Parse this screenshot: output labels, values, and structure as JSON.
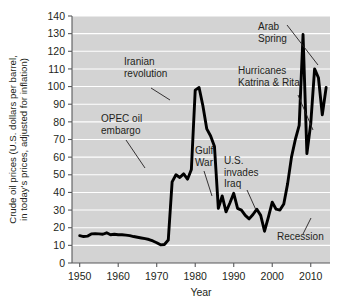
{
  "figure": {
    "name": "crude-oil-prices-chart",
    "background_color": "#ffffff",
    "plot_background_color": "#d3d3d3",
    "gridline_color": "#ffffff",
    "line_color": "#000000"
  },
  "chart_data": {
    "type": "line",
    "title": "",
    "xlabel": "Year",
    "ylabel": "Crude oil prices (U.S. dollars per barrel, in today's prices, adjusted for inflation)",
    "ylabel_line1": "Crude oil prices (U.S. dollars per barrel,",
    "ylabel_line2": "in today's prices, adjusted for inflation)",
    "xlim": [
      1948,
      2015
    ],
    "ylim": [
      0,
      140
    ],
    "grid": "horizontal",
    "legend": "none",
    "y_ticks": [
      0,
      10,
      20,
      30,
      40,
      50,
      60,
      70,
      80,
      90,
      100,
      110,
      120,
      130,
      140
    ],
    "x_ticks": [
      1950,
      1960,
      1970,
      1980,
      1990,
      2000,
      2010
    ],
    "series": [
      {
        "name": "Crude oil price (inflation adjusted)",
        "x": [
          1950,
          1951,
          1952,
          1953,
          1954,
          1955,
          1956,
          1957,
          1958,
          1959,
          1960,
          1961,
          1962,
          1963,
          1964,
          1965,
          1966,
          1967,
          1968,
          1969,
          1970,
          1971,
          1972,
          1973,
          1974,
          1975,
          1976,
          1977,
          1978,
          1979,
          1980,
          1981,
          1982,
          1983,
          1984,
          1985,
          1986,
          1987,
          1988,
          1989,
          1990,
          1991,
          1992,
          1993,
          1994,
          1995,
          1996,
          1997,
          1998,
          1999,
          2000,
          2001,
          2002,
          2003,
          2004,
          2005,
          2006,
          2007,
          2008,
          2009,
          2010,
          2011,
          2012,
          2013,
          2014
        ],
        "values": [
          15.5,
          15.0,
          15.2,
          16.5,
          16.6,
          16.5,
          16.3,
          17.1,
          16.0,
          16.3,
          16.0,
          16.0,
          15.8,
          15.5,
          15.0,
          14.6,
          14.2,
          13.8,
          13.3,
          12.5,
          11.5,
          10.3,
          10.5,
          13.0,
          46.0,
          50.0,
          48.5,
          50.5,
          47.5,
          53.0,
          98.0,
          99.5,
          89.0,
          76.0,
          72.0,
          66.0,
          31.0,
          38.0,
          29.0,
          34.0,
          39.5,
          31.0,
          30.0,
          27.0,
          25.0,
          27.5,
          30.5,
          27.0,
          18.0,
          26.0,
          34.5,
          30.5,
          30.0,
          33.5,
          45.0,
          60.0,
          70.0,
          78.0,
          129.5,
          62.0,
          79.0,
          110.0,
          105.0,
          84.0,
          99.5
        ]
      }
    ],
    "annotations": [
      {
        "id": "opec-oil-embargo",
        "line1": "OPEC oil",
        "line2": "embargo",
        "text": "OPEC oil embargo",
        "label_x": 101,
        "label_y": 122,
        "leader": "M 126 140 L 145 168"
      },
      {
        "id": "iranian-revolution",
        "line1": "Iranian",
        "line2": "revolution",
        "text": "Iranian revolution",
        "label_x": 124,
        "label_y": 65,
        "leader": "M 151 88 L 170 100"
      },
      {
        "id": "gulf-war",
        "line1": "Gulf",
        "line2": "War",
        "text": "Gulf War",
        "label_x": 195,
        "label_y": 154,
        "leader": "M 204 171 L 212 196"
      },
      {
        "id": "us-invades-iraq",
        "line1": "U.S.",
        "line2": "invades",
        "line3": "Iraq",
        "text": "U.S. invades Iraq",
        "label_x": 224,
        "label_y": 164,
        "leader": "M 247 190 L 256 210"
      },
      {
        "id": "hurricanes-katrina-rita",
        "line1": "Hurricanes",
        "line2": "Katrina & Rita",
        "text": "Hurricanes Katrina & Rita",
        "label_x": 238,
        "label_y": 74,
        "leader": "M 298 95 L 313 130"
      },
      {
        "id": "arab-spring",
        "line1": "Arab",
        "line2": "Spring",
        "text": "Arab Spring",
        "label_x": 258,
        "label_y": 30,
        "leader": "M 287 25 L 318 65"
      },
      {
        "id": "recession",
        "line1": "Recession",
        "text": "Recession",
        "label_x": 277,
        "label_y": 240,
        "leader": "M 303 234 L 311 218"
      }
    ]
  }
}
